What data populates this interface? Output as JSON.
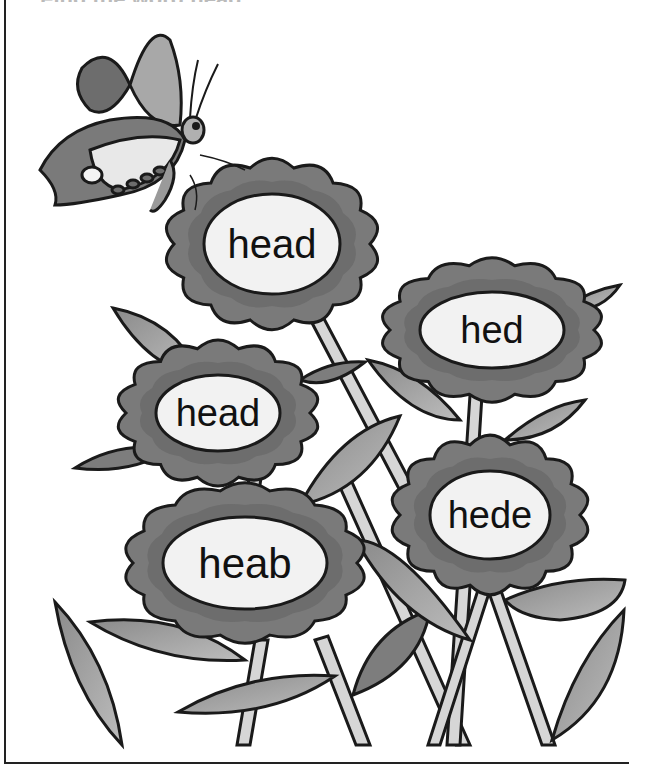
{
  "title_trace": "Find the word head",
  "flowers": [
    {
      "id": "flower-1",
      "word": "head",
      "cx": 272,
      "cy": 244,
      "rx": 68,
      "ry": 50,
      "petal_r": 108,
      "font": 40
    },
    {
      "id": "flower-2",
      "word": "hed",
      "cx": 492,
      "cy": 330,
      "rx": 72,
      "ry": 38,
      "petal_r": 98,
      "font": 38
    },
    {
      "id": "flower-3",
      "word": "head",
      "cx": 218,
      "cy": 413,
      "rx": 62,
      "ry": 38,
      "petal_r": 90,
      "font": 38
    },
    {
      "id": "flower-4",
      "word": "hede",
      "cx": 490,
      "cy": 515,
      "rx": 60,
      "ry": 44,
      "petal_r": 92,
      "font": 38
    },
    {
      "id": "flower-5",
      "word": "heab",
      "cx": 245,
      "cy": 563,
      "rx": 82,
      "ry": 46,
      "petal_r": 112,
      "font": 42
    }
  ],
  "colors": {
    "petal": "#7a7a7a",
    "petal_dark": "#5e5e5e",
    "center": "#f2f2f2",
    "leaf_dark": "#7d7d7d",
    "leaf_light": "#b8b8b8",
    "stem": "#d6d6d6",
    "outline": "#1a1a1a"
  }
}
